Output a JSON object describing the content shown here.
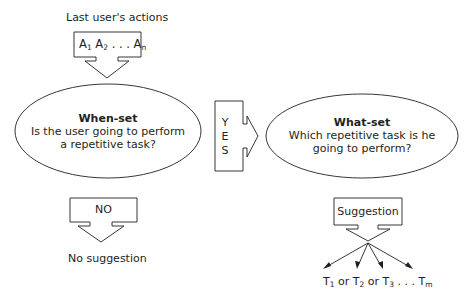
{
  "diagram": {
    "input": {
      "label": "Last user's actions",
      "sequence": {
        "a1": "A",
        "a1_sub": "1",
        "a2": "A",
        "a2_sub": "2",
        "dots": ". . .",
        "an": "A",
        "an_sub": "n"
      }
    },
    "when_set": {
      "title": "When-set",
      "line1": "Is the user going to perform",
      "line2": "a repetitive task?"
    },
    "yes_arrow": {
      "letters": [
        "Y",
        "E",
        "S"
      ]
    },
    "what_set": {
      "title": "What-set",
      "line1": "Which repetitive task is he",
      "line2": "going to perform?"
    },
    "no_arrow": {
      "label": "NO"
    },
    "no_result": "No suggestion",
    "suggestion_arrow": {
      "label": "Suggestion"
    },
    "tasks": {
      "t1": "T",
      "t1_sub": "1",
      "or1": " or ",
      "t2": "T",
      "t2_sub": "2",
      "or2": " or ",
      "t3": "T",
      "t3_sub": "3",
      "dots": " . . . ",
      "tm": "T",
      "tm_sub": "m"
    },
    "colors": {
      "stroke": "#231f20",
      "background": "#ffffff"
    }
  }
}
